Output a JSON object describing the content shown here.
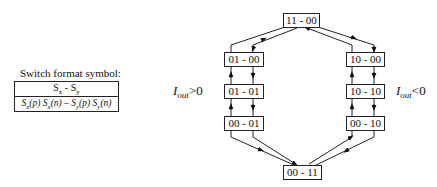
{
  "legend": {
    "title": "Switch format symbol:",
    "row1": "Sx - Sy",
    "row2": "Sx(p) Sx(n) – Sy(p) Sy(n)"
  },
  "labels": {
    "iout_pos": {
      "symbol": "I",
      "sub": "out",
      "cmp": ">0"
    },
    "iout_neg": {
      "symbol": "I",
      "sub": "out",
      "cmp": "<0"
    }
  },
  "states": [
    {
      "id": "s1100",
      "label": "11 - 00"
    },
    {
      "id": "s0100",
      "label": "01 - 00"
    },
    {
      "id": "s0101",
      "label": "01 - 01"
    },
    {
      "id": "s0001",
      "label": "00 - 01"
    },
    {
      "id": "s1000",
      "label": "10 - 00"
    },
    {
      "id": "s1010",
      "label": "10 - 10"
    },
    {
      "id": "s0010",
      "label": "00 - 10"
    },
    {
      "id": "s0011",
      "label": "00 - 11"
    }
  ]
}
